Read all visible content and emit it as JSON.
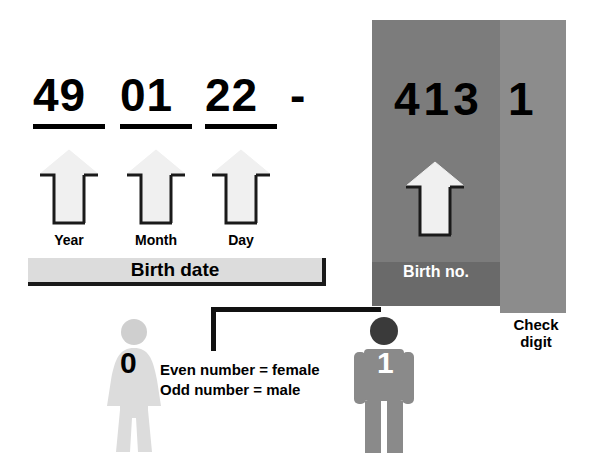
{
  "diagram": {
    "birth_date": {
      "year": "49",
      "month": "01",
      "day": "22",
      "separator": "-",
      "labels": {
        "year": "Year",
        "month": "Month",
        "day": "Day",
        "group": "Birth date"
      }
    },
    "birth_number": {
      "digits": "413",
      "label": "Birth no."
    },
    "check_digit": {
      "digit": "1",
      "label_line1": "Check",
      "label_line2": "digit"
    },
    "gender": {
      "rule_even": "Even number = female",
      "rule_odd": "Odd number = male",
      "female_digit": "0",
      "male_digit": "1"
    },
    "colors": {
      "birthno_panel": "#7c7c7c",
      "checkdigit_panel": "#8c8c8c",
      "birthno_footer": "#6a6a6a",
      "birthdate_bar": "#dcdcdc",
      "arrow_fill": "#f0f0f0",
      "arrow_shadow": "#1a1a1a",
      "female_figure": "#d9d9d9",
      "male_figure": "#8a8a8a",
      "male_head": "#3a3a3a",
      "connector": "#111111",
      "text_dark": "#000000",
      "text_light": "#ffffff"
    }
  }
}
